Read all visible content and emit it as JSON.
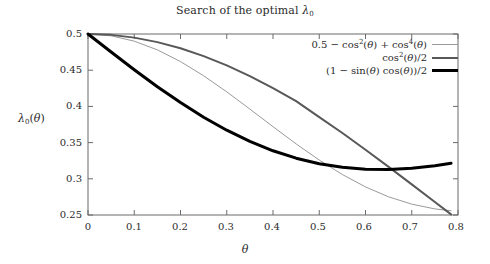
{
  "chart_data": {
    "type": "line",
    "xlabel": "θ",
    "ylabel": "λ₀(θ)",
    "xlim": [
      0,
      0.8
    ],
    "ylim": [
      0.25,
      0.5
    ],
    "xticks": [
      "0",
      "0.1",
      "0.2",
      "0.3",
      "0.4",
      "0.5",
      "0.6",
      "0.7",
      "0.8"
    ],
    "xtick_values": [
      0,
      0.1,
      0.2,
      0.3,
      0.4,
      0.5,
      0.6,
      0.7,
      0.8
    ],
    "yticks": [
      "0.25",
      "0.3",
      "0.35",
      "0.4",
      "0.45",
      "0.5"
    ],
    "ytick_values": [
      0.25,
      0.3,
      0.35,
      0.4,
      0.45,
      0.5
    ],
    "grid": false,
    "legend_position": "top-right-inside",
    "series": [
      {
        "name": "0.5 − cos²(θ) + cos⁴(θ)",
        "color": "#9a9a9a",
        "width": 1,
        "x": [
          0.0,
          0.05,
          0.1,
          0.15,
          0.2,
          0.25,
          0.3,
          0.35,
          0.4,
          0.45,
          0.5,
          0.55,
          0.6,
          0.65,
          0.7,
          0.75,
          0.785
        ],
        "y": [
          0.5,
          0.4975,
          0.4901,
          0.4781,
          0.4619,
          0.4423,
          0.4201,
          0.3963,
          0.372,
          0.3482,
          0.3259,
          0.3059,
          0.2888,
          0.2751,
          0.265,
          0.2584,
          0.2559
        ]
      },
      {
        "name": "cos²(θ)/2",
        "color": "#585858",
        "width": 2,
        "x": [
          0.0,
          0.05,
          0.1,
          0.15,
          0.2,
          0.25,
          0.3,
          0.35,
          0.4,
          0.45,
          0.5,
          0.55,
          0.6,
          0.65,
          0.7,
          0.75,
          0.785
        ],
        "y": [
          0.5,
          0.4988,
          0.495,
          0.4888,
          0.4803,
          0.4695,
          0.4566,
          0.4419,
          0.4253,
          0.4073,
          0.3851,
          0.3632,
          0.3402,
          0.3165,
          0.2923,
          0.2679,
          0.2509
        ]
      },
      {
        "name": "(1 − sin(θ) cos(θ))/2",
        "color": "#000000",
        "width": 3,
        "x": [
          0.0,
          0.05,
          0.1,
          0.15,
          0.2,
          0.25,
          0.3,
          0.35,
          0.4,
          0.45,
          0.5,
          0.55,
          0.6,
          0.65,
          0.7,
          0.75,
          0.785
        ],
        "y": [
          0.5,
          0.4751,
          0.4507,
          0.4272,
          0.4053,
          0.3851,
          0.3671,
          0.3516,
          0.3387,
          0.3285,
          0.3209,
          0.3159,
          0.3133,
          0.3129,
          0.3146,
          0.3181,
          0.3214
        ]
      }
    ]
  },
  "axes": {
    "x_tick_labels": [
      "0",
      "0.1",
      "0.2",
      "0.3",
      "0.4",
      "0.5",
      "0.6",
      "0.7",
      "0.8"
    ],
    "y_tick_labels": [
      "0.5",
      "0.45",
      "0.4",
      "0.35",
      "0.3",
      "0.25"
    ],
    "x_axis_title": "θ",
    "y_axis_title": "λ₀(θ)"
  },
  "legend": {
    "entries": [
      {
        "label": "0.5 − cos²(θ) + cos⁴(θ)",
        "style": "thin"
      },
      {
        "label": "cos²(θ)/2",
        "style": "medium"
      },
      {
        "label": "(1 − sin(θ) cos(θ))/2",
        "style": "thick"
      }
    ]
  }
}
